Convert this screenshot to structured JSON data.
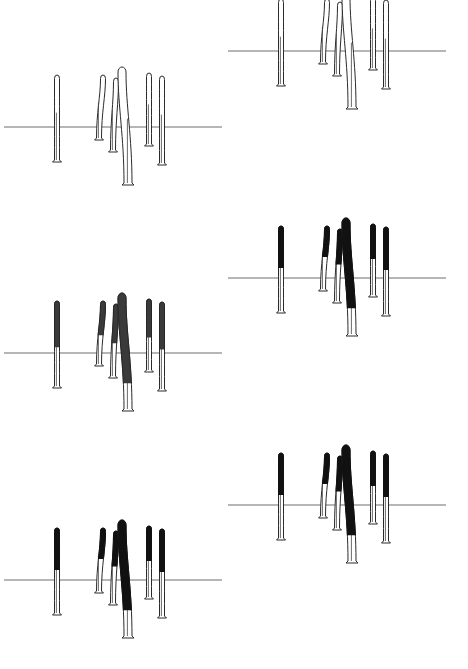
{
  "figure": {
    "background": "#ffffff",
    "line_color": "#6e6e6e",
    "stain_color": "#111111",
    "panels": [
      {
        "id": "A",
        "stage": "unstained-outline",
        "x0": 4,
        "x1": 222,
        "line_y": 127,
        "dy": 0,
        "style": "outline",
        "stain_frac": 0
      },
      {
        "id": "B",
        "stage": "outline-with-markings",
        "x0": 228,
        "x1": 446,
        "line_y": 51,
        "dy": -76,
        "style": "outline",
        "stain_frac": 0
      },
      {
        "id": "C",
        "stage": "stippled-partial",
        "x0": 4,
        "x1": 222,
        "line_y": 353,
        "dy": 226,
        "style": "dot",
        "stain_frac": 0.55
      },
      {
        "id": "D",
        "stage": "solid-partial",
        "x0": 228,
        "x1": 446,
        "line_y": 278,
        "dy": 151,
        "style": "full",
        "stain_frac": 0.5
      },
      {
        "id": "E",
        "stage": "solid-partial",
        "x0": 4,
        "x1": 222,
        "line_y": 580,
        "dy": 453,
        "style": "full",
        "stain_frac": 0.5
      },
      {
        "id": "F",
        "stage": "solid-partial",
        "x0": 228,
        "x1": 446,
        "line_y": 505,
        "dy": 378,
        "style": "full",
        "stain_frac": 0.5
      }
    ],
    "shapes": [
      {
        "name": "shape-1",
        "x": 57,
        "top": 74,
        "bottom": 160,
        "w": 5,
        "bend": 0
      },
      {
        "name": "shape-2",
        "x": 99,
        "top": 74,
        "bottom": 138,
        "w": 5,
        "bend": 4
      },
      {
        "name": "shape-3",
        "x": 113,
        "top": 77,
        "bottom": 150,
        "w": 5,
        "bend": 3
      },
      {
        "name": "shape-4",
        "x": 128,
        "top": 66,
        "bottom": 183,
        "w": 8,
        "bend": -6
      },
      {
        "name": "shape-5",
        "x": 149,
        "top": 72,
        "bottom": 144,
        "w": 5,
        "bend": 0
      },
      {
        "name": "shape-6",
        "x": 162,
        "top": 75,
        "bottom": 163,
        "w": 5,
        "bend": 0
      }
    ],
    "panel_offsets_x": {
      "left": 0,
      "right": 224
    }
  }
}
